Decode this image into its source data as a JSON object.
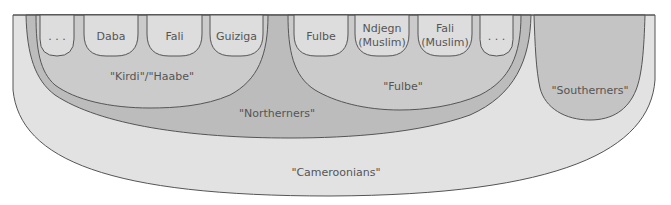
{
  "diagram": {
    "colors": {
      "cameroonians": "#e2e2e2",
      "northerners": "#bcbcbc",
      "subgroup": "#cbcbcb",
      "pill": "#dddddd",
      "southerners": "#c4c4c4",
      "stroke": "#555555",
      "text": "#555555"
    },
    "groups": {
      "cameroonians": {
        "label": "\"Cameroonians\""
      },
      "northerners": {
        "label": "\"Northerners\""
      },
      "kirdi": {
        "label": "\"Kirdi\"/\"Haabe\""
      },
      "fulbe": {
        "label": "\"Fulbe\""
      },
      "southerners": {
        "label": "\"Southerners\""
      }
    },
    "kirdi_members": [
      {
        "line1": ". . .",
        "line2": ""
      },
      {
        "line1": "Daba",
        "line2": ""
      },
      {
        "line1": "Fali",
        "line2": ""
      },
      {
        "line1": "Guiziga",
        "line2": ""
      }
    ],
    "fulbe_members": [
      {
        "line1": "Fulbe",
        "line2": ""
      },
      {
        "line1": "Ndjegn",
        "line2": "(Muslim)"
      },
      {
        "line1": "Fali",
        "line2": "(Muslim)"
      },
      {
        "line1": ". . .",
        "line2": ""
      }
    ]
  }
}
